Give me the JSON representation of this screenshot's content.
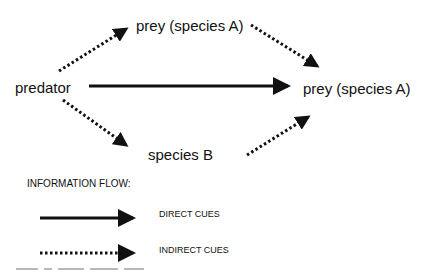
{
  "diagram": {
    "nodes": {
      "predator": "predator",
      "prey_top": "prey (species A)",
      "prey_right": "prey (species A)",
      "species_b": "species B"
    },
    "edges": [
      {
        "from": "predator",
        "to": "prey_top",
        "style": "dotted",
        "meaning": "indirect cue"
      },
      {
        "from": "prey_top",
        "to": "prey_right",
        "style": "dotted",
        "meaning": "indirect cue"
      },
      {
        "from": "predator",
        "to": "prey_right",
        "style": "solid",
        "meaning": "direct cue"
      },
      {
        "from": "predator",
        "to": "species_b",
        "style": "dotted",
        "meaning": "indirect cue"
      },
      {
        "from": "species_b",
        "to": "prey_right",
        "style": "dotted",
        "meaning": "indirect cue"
      }
    ],
    "legend": {
      "title": "INFORMATION FLOW:",
      "items": [
        {
          "style": "solid",
          "label": "DIRECT CUES"
        },
        {
          "style": "dotted",
          "label": "INDIRECT CUES"
        }
      ]
    },
    "colors": {
      "ink": "#111111",
      "background": "#ffffff"
    }
  }
}
